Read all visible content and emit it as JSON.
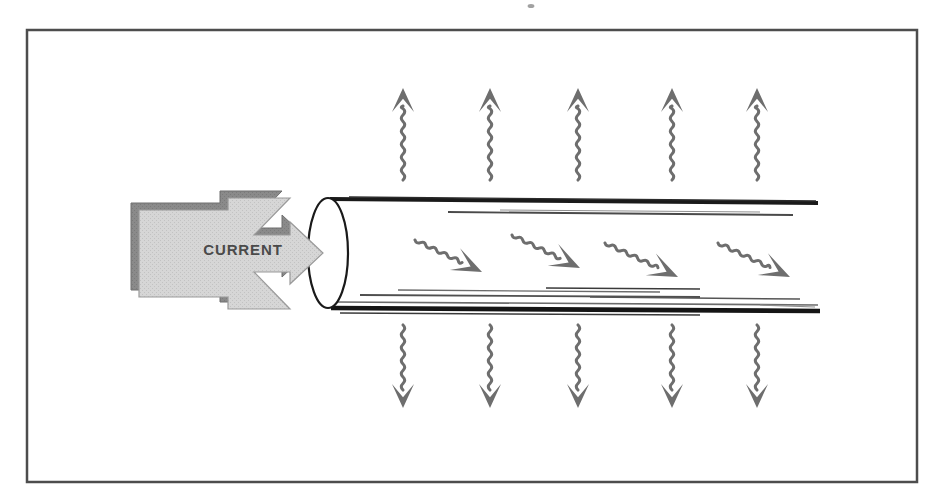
{
  "figure": {
    "kind": "technical-illustration",
    "canvas": {
      "width": 935,
      "height": 503
    },
    "background_color": "#ffffff"
  },
  "frame": {
    "name": "outer-border",
    "x": 27,
    "y": 30,
    "width": 890,
    "height": 452,
    "stroke_color": "#4d4d4d",
    "stroke_width": 2.5,
    "fill": "#ffffff"
  },
  "colors": {
    "arrow_face": "#d2d2d2",
    "arrow_shadow": "#8a8a8a",
    "arrow_outline": "#7d7d7d",
    "label_text": "#4a4a4a",
    "wavy_arrow": "#6e6e6e",
    "pipe_wall_dark": "#1a1a1a",
    "pipe_wall_mid": "#555555",
    "pipe_wall_light": "#8f8f8f",
    "ellipse_stroke": "#1a1a1a",
    "ellipse_fill": "#ffffff"
  },
  "current_arrow": {
    "name": "current-block-arrow",
    "label": "CURRENT",
    "label_x": 243,
    "label_y": 255,
    "direction": "right",
    "style": "3d-block-chevron",
    "face_color": "#d2d2d2",
    "shadow_color": "#8a8a8a",
    "face_points": "139,210 228,210 228,198 290,198 254,235 290,235 290,222 323,253 290,284 290,272 254,272 290,309 228,309 228,297 139,297",
    "shadow_points": "131,203 220,203 220,191 282,191 246,228 282,228 282,215 315,246 282,277 282,265 246,265 282,302 220,302 220,290 131,290"
  },
  "pipe": {
    "name": "conductor-pipe",
    "mouth_ellipse": {
      "name": "pipe-mouth-ellipse",
      "cx": 328,
      "cy": 253,
      "rx": 20,
      "ry": 55,
      "fill": "#ffffff",
      "stroke": "#1a1a1a",
      "stroke_width": 2.2
    },
    "top_wall_lines": [
      {
        "x1": 330,
        "y1": 199,
        "x2": 818,
        "y2": 203,
        "width": 4.0,
        "color": "#1a1a1a"
      },
      {
        "x1": 349,
        "y1": 197,
        "x2": 816,
        "y2": 201,
        "width": 1.4,
        "color": "#2b2b2b"
      },
      {
        "x1": 448,
        "y1": 212,
        "x2": 793,
        "y2": 215,
        "width": 1.8,
        "color": "#4a4a4a"
      },
      {
        "x1": 500,
        "y1": 210,
        "x2": 760,
        "y2": 212,
        "width": 1.0,
        "color": "#8f8f8f"
      }
    ],
    "bottom_wall_lines": [
      {
        "x1": 336,
        "y1": 302,
        "x2": 818,
        "y2": 305,
        "width": 1.6,
        "color": "#6b6b6b"
      },
      {
        "x1": 360,
        "y1": 295,
        "x2": 700,
        "y2": 297,
        "width": 1.8,
        "color": "#4f4f4f"
      },
      {
        "x1": 398,
        "y1": 290,
        "x2": 660,
        "y2": 292,
        "width": 1.4,
        "color": "#6b6b6b"
      },
      {
        "x1": 546,
        "y1": 288,
        "x2": 700,
        "y2": 289,
        "width": 1.6,
        "color": "#3a3a3a"
      },
      {
        "x1": 590,
        "y1": 297,
        "x2": 800,
        "y2": 299,
        "width": 1.5,
        "color": "#555555"
      },
      {
        "x1": 331,
        "y1": 308,
        "x2": 820,
        "y2": 311,
        "width": 4.6,
        "color": "#151515"
      },
      {
        "x1": 340,
        "y1": 313,
        "x2": 700,
        "y2": 315,
        "width": 1.4,
        "color": "#3a3a3a"
      },
      {
        "x1": 760,
        "y1": 305,
        "x2": 815,
        "y2": 307,
        "width": 1.2,
        "color": "#8f8f8f"
      }
    ]
  },
  "heat_arrows_up": {
    "name": "heat-radiating-up",
    "count": 5,
    "direction": "up",
    "color": "#6e6e6e",
    "tail_y": 180,
    "head_y": 88,
    "x_positions": [
      403,
      490,
      578,
      672,
      757
    ]
  },
  "heat_arrows_down": {
    "name": "heat-radiating-down",
    "count": 5,
    "direction": "down",
    "color": "#6e6e6e",
    "tail_y": 325,
    "head_y": 408,
    "x_positions": [
      403,
      490,
      578,
      672,
      757
    ]
  },
  "flow_arrows": {
    "name": "internal-flow-arrows",
    "count": 4,
    "direction": "down-right",
    "color": "#6e6e6e",
    "items": [
      {
        "x1": 415,
        "y1": 240,
        "x2": 482,
        "y2": 272
      },
      {
        "x1": 512,
        "y1": 235,
        "x2": 580,
        "y2": 268
      },
      {
        "x1": 605,
        "y1": 243,
        "x2": 678,
        "y2": 277
      },
      {
        "x1": 718,
        "y1": 243,
        "x2": 790,
        "y2": 277
      }
    ]
  },
  "speck_marks": [
    {
      "name": "scan-speck",
      "cx": 531,
      "cy": 6,
      "r": 3.4,
      "color": "#8a8a8a"
    }
  ]
}
